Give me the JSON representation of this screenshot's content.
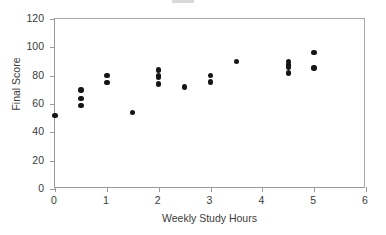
{
  "chart_data": {
    "type": "scatter",
    "title": "",
    "xlabel": "Weekly Study Hours",
    "ylabel": "Final Score",
    "xlim": [
      0,
      6
    ],
    "ylim": [
      0,
      120
    ],
    "xticks": [
      "0",
      "1",
      "2",
      "3",
      "4",
      "5",
      "6"
    ],
    "xtick_values": [
      0,
      1,
      2,
      3,
      4,
      5,
      6
    ],
    "yticks": [
      "0",
      "20",
      "40",
      "60",
      "80",
      "100",
      "120"
    ],
    "ytick_values": [
      0,
      20,
      40,
      60,
      80,
      100,
      120
    ],
    "grid": false,
    "legend": null,
    "marker": {
      "shape": "circle",
      "color": "#161616",
      "size_px": 5.4
    },
    "frame_color": "#9a9a9a",
    "background_color": "#ffffff",
    "points": [
      {
        "x": 0,
        "y": 52
      },
      {
        "x": 0.5,
        "y": 70
      },
      {
        "x": 0.5,
        "y": 64
      },
      {
        "x": 0.5,
        "y": 59
      },
      {
        "x": 1,
        "y": 80
      },
      {
        "x": 1,
        "y": 75
      },
      {
        "x": 1.5,
        "y": 54
      },
      {
        "x": 2,
        "y": 84
      },
      {
        "x": 2,
        "y": 80
      },
      {
        "x": 2,
        "y": 79
      },
      {
        "x": 2,
        "y": 74
      },
      {
        "x": 2.5,
        "y": 72
      },
      {
        "x": 3,
        "y": 80
      },
      {
        "x": 3,
        "y": 75.5
      },
      {
        "x": 3.5,
        "y": 90
      },
      {
        "x": 4.5,
        "y": 90
      },
      {
        "x": 4.5,
        "y": 87.5
      },
      {
        "x": 4.5,
        "y": 86
      },
      {
        "x": 4.5,
        "y": 82
      },
      {
        "x": 5,
        "y": 96.5
      },
      {
        "x": 5,
        "y": 85.5
      }
    ]
  },
  "axes": {
    "x_title": "Weekly Study Hours",
    "y_title": "Final Score"
  }
}
